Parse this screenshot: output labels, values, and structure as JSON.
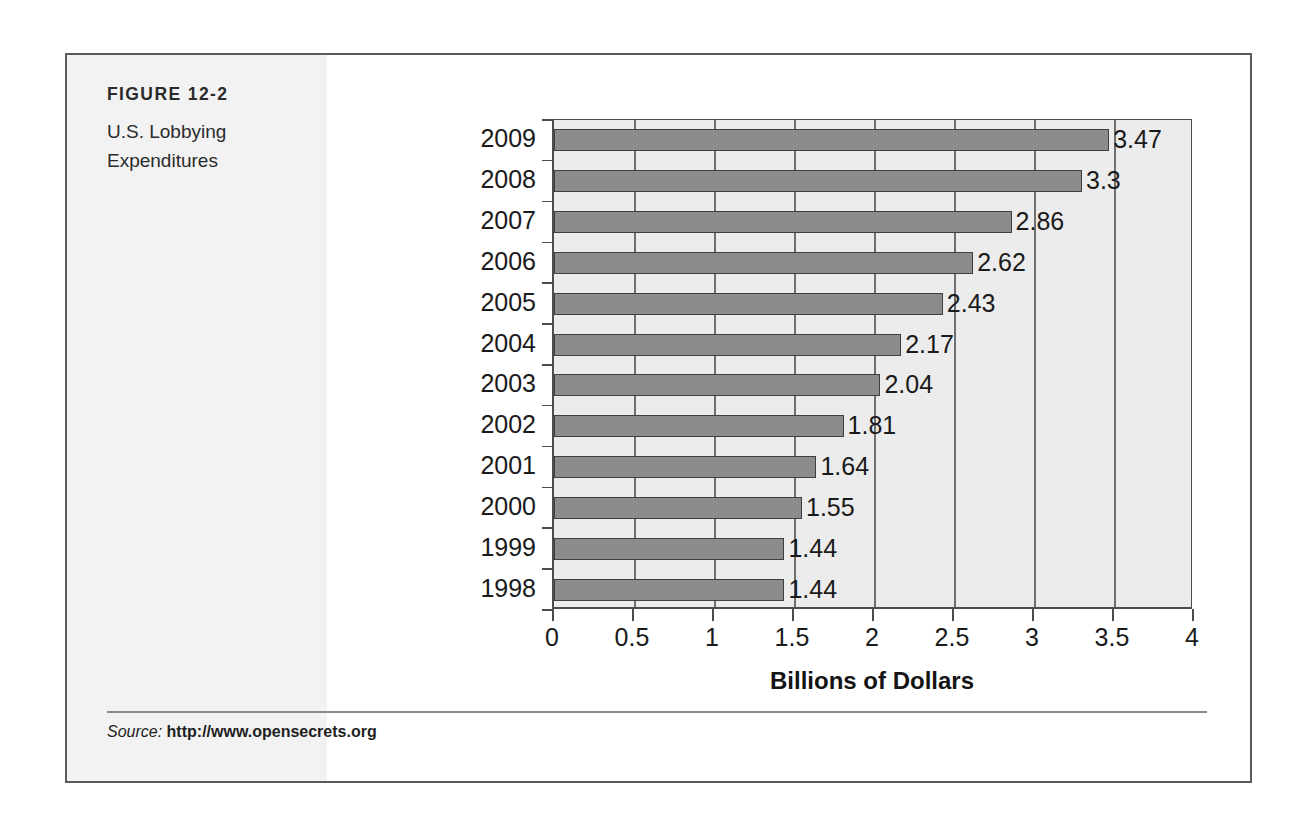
{
  "figure": {
    "number": "FIGURE 12-2",
    "title_line1": "U.S. Lobbying",
    "title_line2": "Expenditures"
  },
  "source": {
    "label": "Source:",
    "url": "http://www.opensecrets.org"
  },
  "colors": {
    "bar_fill": "#8c8c8c",
    "bar_outline": "#3f3f3f",
    "plot_background": "#ececec",
    "caption_band": "#f2f2f2",
    "frame": "#5a5a5a"
  },
  "chart_data": {
    "type": "bar",
    "orientation": "horizontal",
    "title": "U.S. Lobbying Expenditures",
    "xlabel": "Billions of Dollars",
    "ylabel": "",
    "xlim": [
      0,
      4
    ],
    "xticks": [
      "0",
      "0.5",
      "1",
      "1.5",
      "2",
      "2.5",
      "3",
      "3.5",
      "4"
    ],
    "xtick_values": [
      0,
      0.5,
      1,
      1.5,
      2,
      2.5,
      3,
      3.5,
      4
    ],
    "grid": true,
    "legend": false,
    "categories": [
      "2009",
      "2008",
      "2007",
      "2006",
      "2005",
      "2004",
      "2003",
      "2002",
      "2001",
      "2000",
      "1999",
      "1998"
    ],
    "values": [
      3.47,
      3.3,
      2.86,
      2.62,
      2.43,
      2.17,
      2.04,
      1.81,
      1.64,
      1.55,
      1.44,
      1.44
    ],
    "data_labels": [
      "3.47",
      "3.3",
      "2.86",
      "2.62",
      "2.43",
      "2.17",
      "2.04",
      "1.81",
      "1.64",
      "1.55",
      "1.44",
      "1.44"
    ],
    "series": [
      {
        "name": "Lobbying Expenditures",
        "values": [
          3.47,
          3.3,
          2.86,
          2.62,
          2.43,
          2.17,
          2.04,
          1.81,
          1.64,
          1.55,
          1.44,
          1.44
        ]
      }
    ]
  }
}
